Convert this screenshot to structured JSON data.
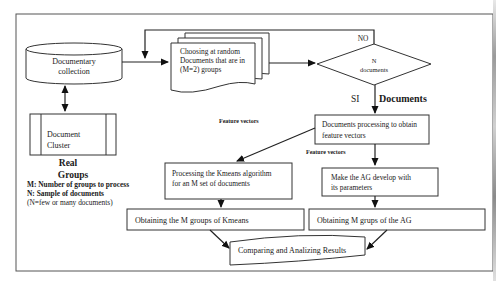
{
  "diagram": {
    "nodes": {
      "documentary_collection": {
        "line1": "Documentary",
        "line2": "collection"
      },
      "document_cluster": {
        "line1": "Document",
        "line2": "Cluster"
      },
      "real_groups": {
        "line1": "Real",
        "line2": "Groups"
      },
      "choosing": {
        "line1": "Choosing at random",
        "line2": "Documents that are in",
        "line3": "(M=2)  groups"
      },
      "decision": {
        "line1": "N",
        "line2": "documents"
      },
      "processing": {
        "line1": "Documents processing to obtain",
        "line2": "feature vectors"
      },
      "kmeans": {
        "line1": "Processing the Kmeans algorithm",
        "line2": "for an  M set of documents"
      },
      "ag_develop": {
        "line1": "Make the AG develop  with",
        "line2": "its parameters"
      },
      "kmeans_groups": {
        "label": "Obtaining the M groups of Kmeans"
      },
      "ag_groups": {
        "label": "Obtaining M grups of the AG"
      },
      "compare": {
        "label": "Comparing  and Analizing Results"
      }
    },
    "edge_labels": {
      "no": "NO",
      "si": "SI",
      "documents": "Documents",
      "feature_vectors_left": "Feature vectors",
      "feature_vectors_right": "Feature vectors"
    },
    "legend": {
      "m": "M: Number of groups to process",
      "n": "N: Sample of documents",
      "note": "(N=few or many documents)"
    }
  }
}
